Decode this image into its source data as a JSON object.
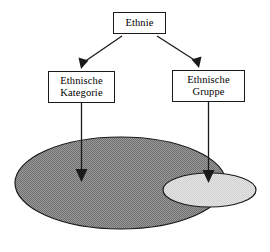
{
  "diagram": {
    "type": "hierarchy-with-set-ellipses",
    "background_color": "#ffffff",
    "line_color": "#1a1a1a",
    "nodes": [
      {
        "id": "ethnie",
        "label": "Ethnie",
        "role": "root-concept"
      },
      {
        "id": "kategorie",
        "label": "Ethnische\nKategorie",
        "role": "left-branch-concept"
      },
      {
        "id": "gruppe",
        "label": "Ethnische\nGruppe",
        "role": "right-branch-concept"
      }
    ],
    "connectors": [
      {
        "id": "ethnie-to-kategorie",
        "from": "ethnie",
        "to": "kategorie",
        "style": "diagonal-arrow"
      },
      {
        "id": "ethnie-to-gruppe",
        "from": "ethnie",
        "to": "gruppe",
        "style": "diagonal-arrow"
      },
      {
        "id": "kategorie-to-large-ellipse",
        "from": "kategorie",
        "to": "large-ellipse",
        "style": "vertical-arrow"
      },
      {
        "id": "gruppe-to-small-ellipse",
        "from": "gruppe",
        "to": "small-ellipse",
        "style": "vertical-arrow"
      }
    ],
    "ellipses": [
      {
        "id": "large-ellipse",
        "fill_color": "#8a8a8a",
        "stroke_color": "#1a1a1a",
        "represents": "Ethnische Kategorie",
        "cx": 120.5,
        "cy": 183,
        "rx": 105.5,
        "ry": 46
      },
      {
        "id": "small-ellipse",
        "fill_color": "#dcdcdc",
        "stroke_color": "#1a1a1a",
        "represents": "Ethnische Gruppe",
        "cx": 209.5,
        "cy": 190,
        "rx": 46.5,
        "ry": 17
      }
    ]
  }
}
